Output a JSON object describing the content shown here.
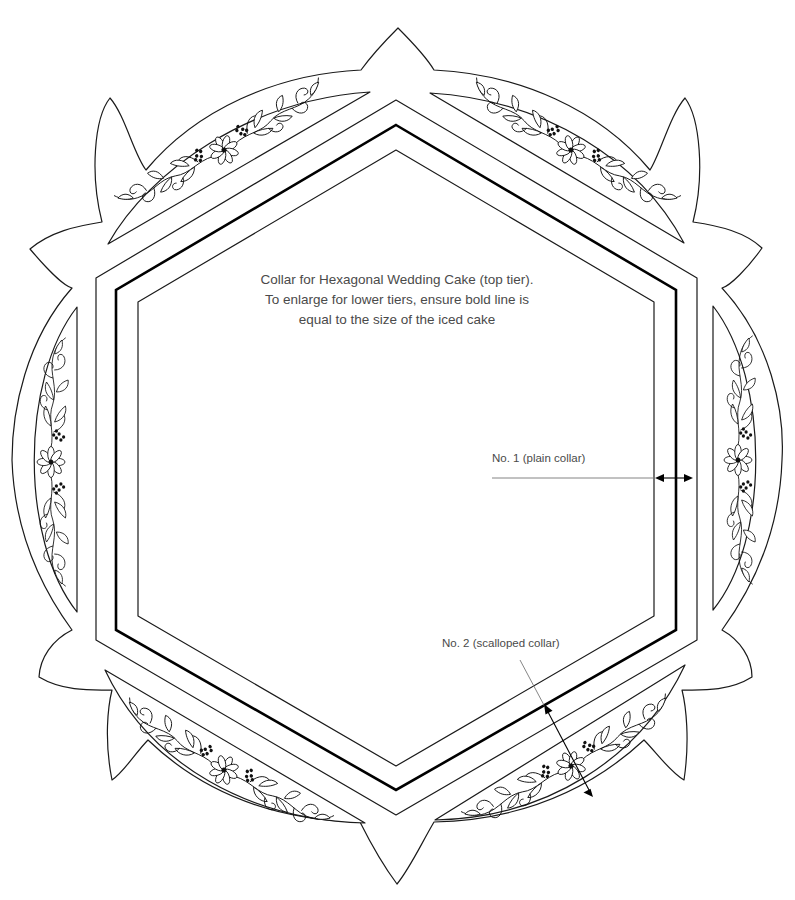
{
  "diagram": {
    "instructions": [
      "Collar for Hexagonal Wedding Cake (top tier).",
      "To enlarge for lower tiers, ensure bold line is",
      "equal to the size of the iced cake"
    ],
    "callouts": {
      "plain_collar": "No. 1 (plain collar)",
      "scalloped_collar": "No. 2 (scalloped collar)"
    },
    "shapes": {
      "outer_hexagon": "collar outer edge (No. 1)",
      "bold_hexagon": "cake size guide (bold line)",
      "inner_hexagon": "collar inner edge",
      "scalloped_outline": "6-point scalloped outer edge (No. 2)",
      "decorative_panels": 6,
      "panel_motif": "flower-and-vine"
    },
    "colors": {
      "line": "#1a1a1a",
      "bold_line": "#000000",
      "text": "#4a4a4a",
      "leader": "#777777",
      "background": "#ffffff"
    }
  }
}
